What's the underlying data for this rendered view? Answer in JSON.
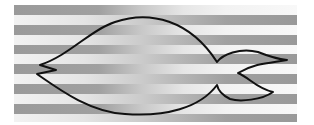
{
  "figure": {
    "width": 314,
    "height": 125,
    "colors": {
      "background": "#ffffff",
      "stripe_dark": "#9a9a9a",
      "stripe_light": "#f4f4f4",
      "outline": "#111111"
    },
    "stripes_left": [
      {
        "y": 5,
        "h": 10
      },
      {
        "y": 25,
        "h": 10
      },
      {
        "y": 45,
        "h": 9
      },
      {
        "y": 64,
        "h": 10
      },
      {
        "y": 84,
        "h": 10
      },
      {
        "y": 104,
        "h": 10
      }
    ],
    "stripes_right": [
      {
        "y": 15,
        "h": 10
      },
      {
        "y": 35,
        "h": 10
      },
      {
        "y": 54,
        "h": 10
      },
      {
        "y": 74,
        "h": 10
      },
      {
        "y": 94,
        "h": 10
      },
      {
        "y": 114,
        "h": 8
      }
    ],
    "stripe_x_start": 14,
    "stripe_x_end": 297
  }
}
